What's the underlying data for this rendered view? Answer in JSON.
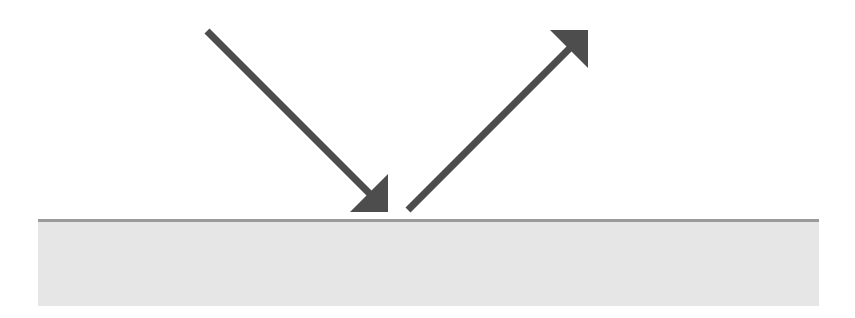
{
  "diagram": {
    "type": "reflection",
    "colors": {
      "arrow": "#4d4d4d",
      "surface_fill": "#e6e6e6",
      "surface_edge": "#9a9a9a",
      "background": "#ffffff"
    },
    "surface": {
      "x": 38,
      "y": 220,
      "width": 781,
      "height": 86
    },
    "arrows": [
      {
        "name": "incident-ray",
        "from": [
          207,
          31
        ],
        "to": [
          388,
          212
        ]
      },
      {
        "name": "reflected-ray",
        "from": [
          408,
          210
        ],
        "to": [
          588,
          30
        ]
      }
    ]
  }
}
